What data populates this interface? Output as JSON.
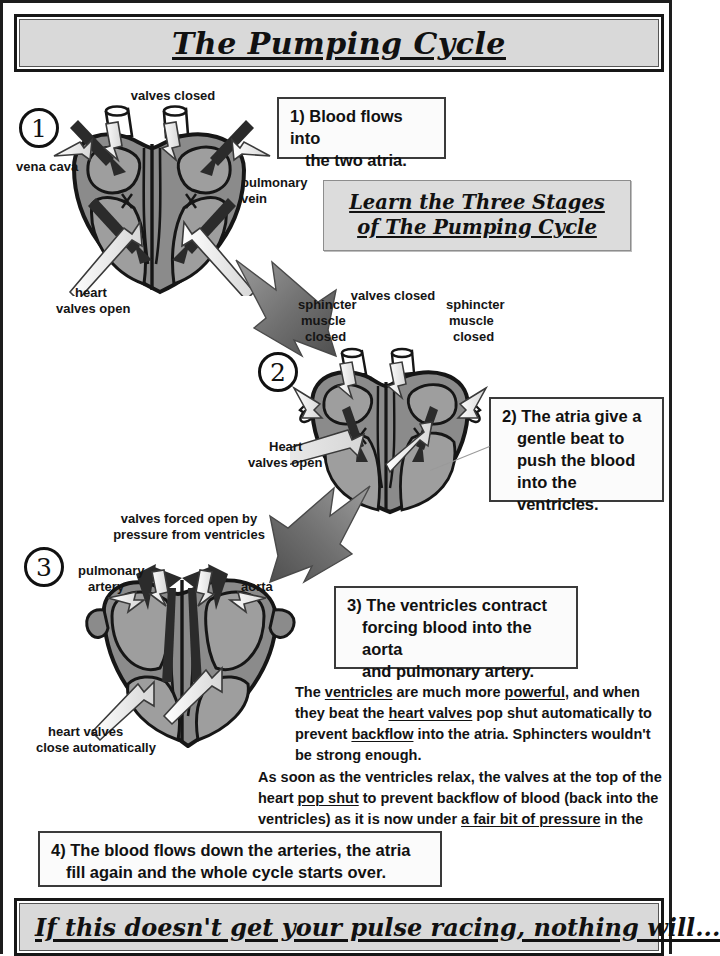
{
  "page": {
    "title": "The Pumping Cycle",
    "footer": "If this doesn't get your pulse racing, nothing will..."
  },
  "callout": {
    "line1": "Learn the Three Stages",
    "line2": "of The Pumping Cycle"
  },
  "statements": [
    {
      "id": "stmt-1",
      "number": "1)",
      "line1": "Blood flows into",
      "line2": "the two atria.",
      "line3": "",
      "line4": ""
    },
    {
      "id": "stmt-2",
      "number": "2)",
      "line1": "The atria give a",
      "line2": "gentle beat to",
      "line3": "push the blood",
      "line4": "into the ventricles."
    },
    {
      "id": "stmt-3",
      "number": "3)",
      "line1": "The ventricles contract",
      "line2": "forcing blood into the aorta",
      "line3": "and pulmonary artery.",
      "line4": ""
    },
    {
      "id": "stmt-4",
      "number": "4)",
      "line1": "The blood flows down the arteries, the atria",
      "line2": "fill again and the whole cycle starts over.",
      "line3": "",
      "line4": ""
    }
  ],
  "paragraphs": {
    "p1": {
      "t1": "The ",
      "u1": "ventricles",
      "t2": " are much more ",
      "u2": "powerful",
      "t3": ", and when they beat the ",
      "u3": "heart valves",
      "t4": " pop shut automatically to prevent ",
      "u4": "backflow",
      "t5": " into the atria.  Sphincters wouldn't be strong enough."
    },
    "p2": {
      "t1": "As soon as the ventricles relax, the valves at the top of the heart ",
      "u1": "pop shut",
      "t2": " to prevent backflow of blood (back into the ventricles) as it is now under ",
      "u2": "a fair bit of pressure",
      "t3": " in the arteries."
    }
  },
  "stages": [
    {
      "num": "1"
    },
    {
      "num": "2"
    },
    {
      "num": "3"
    }
  ],
  "labels": {
    "stage1": {
      "valves_closed": "valves closed",
      "vena_cava": "vena cava",
      "pulmonary_vein_l1": "pulmonary",
      "pulmonary_vein_l2": "vein",
      "heart_valves_open_l1": "heart",
      "heart_valves_open_l2": "valves open"
    },
    "stage2": {
      "sphincter_left_l1": "sphincter",
      "sphincter_left_l2": "muscle",
      "sphincter_left_l3": "closed",
      "valves_closed": "valves closed",
      "sphincter_right_l1": "sphincter",
      "sphincter_right_l2": "muscle",
      "sphincter_right_l3": "closed",
      "heart_valves_open_l1": "Heart",
      "heart_valves_open_l2": "valves open"
    },
    "stage3": {
      "valves_forced_l1": "valves forced open by",
      "valves_forced_l2": "pressure from ventricles",
      "pulmonary_artery_l1": "pulmonary",
      "pulmonary_artery_l2": "artery",
      "aorta": "aorta",
      "heart_valves_close_l1": "heart valves",
      "heart_valves_close_l2": "close automatically"
    }
  },
  "colors": {
    "banner_fill": "#d9d9d9",
    "callout_fill": "#dcdcdc",
    "heart_muscle": "#8b8b8b",
    "heart_chamber": "#9e9e9e",
    "outline": "#161616",
    "arrow_dark": "#6e6e6e",
    "arrow_light": "#f2f2f2"
  }
}
